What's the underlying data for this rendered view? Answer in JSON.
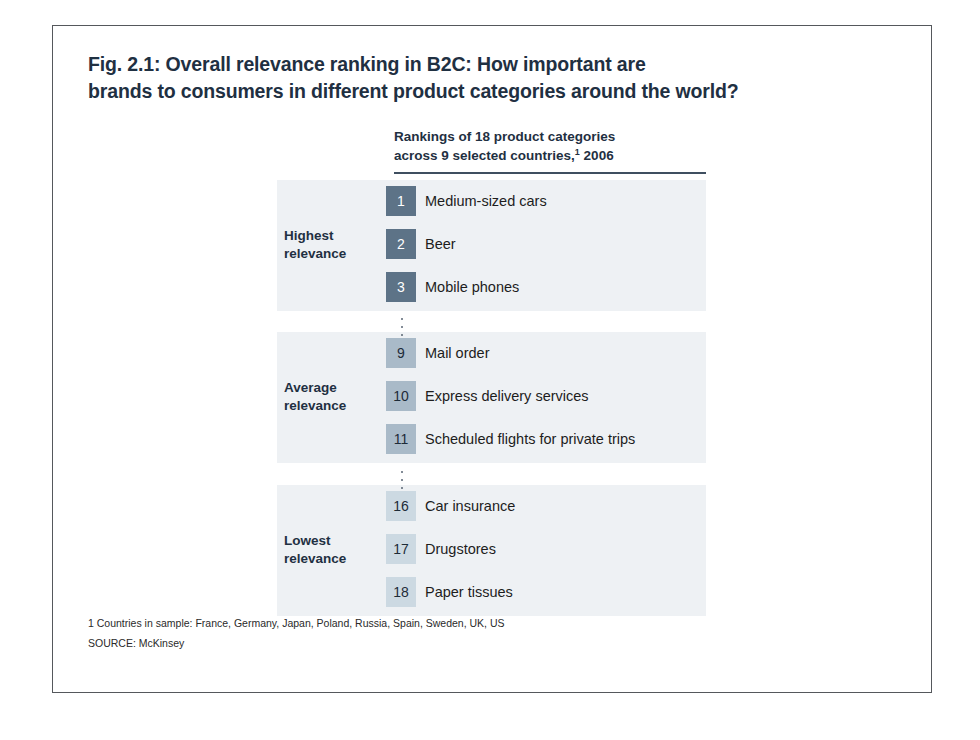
{
  "figure": {
    "title_lines": [
      "Fig. 2.1: Overall relevance ranking in B2C: How important are",
      "brands to consumers in different product categories around the world?"
    ],
    "subtitle_lines": [
      "Rankings of 18 product categories",
      "across 9 selected countries,"
    ],
    "subtitle_superscript": "1",
    "subtitle_tail": " 2006"
  },
  "colors": {
    "title_text": "#1f3042",
    "band_background": "#eef1f4",
    "rule": "#3f4f60",
    "box_high": "#5d7387",
    "box_high_text": "#ffffff",
    "box_average": "#a9bac8",
    "box_average_text": "#1d2b38",
    "box_lowest": "#ccd9e2",
    "box_lowest_text": "#1d2b38",
    "page_border": "#55585c"
  },
  "footnotes": [
    "1 Countries in sample: France, Germany, Japan, Poland, Russia, Spain, Sweden, UK, US",
    "SOURCE: McKinsey"
  ],
  "chart_data": {
    "type": "table",
    "title": "Fig. 2.1: Overall relevance ranking in B2C: How important are brands to consumers in different product categories around the world?",
    "subtitle": "Rankings of 18 product categories across 9 selected countries,1 2006",
    "xlabel": "",
    "ylabel": "",
    "columns": [
      "Rank",
      "Product category"
    ],
    "note": "18 product categories ranked; only ranks 1-3, 9-11 and 16-18 are shown, separated by vertical ellipses.",
    "groups": [
      {
        "label_lines": [
          "Highest",
          "relevance"
        ],
        "label": "Highest relevance",
        "box_color": "#5d7387",
        "box_text_color": "#ffffff",
        "rows": [
          {
            "rank": "1",
            "category": "Medium-sized cars"
          },
          {
            "rank": "2",
            "category": "Beer"
          },
          {
            "rank": "3",
            "category": "Mobile phones"
          }
        ]
      },
      {
        "label_lines": [
          "Average",
          "relevance"
        ],
        "label": "Average relevance",
        "box_color": "#a9bac8",
        "box_text_color": "#1d2b38",
        "rows": [
          {
            "rank": "9",
            "category": "Mail order"
          },
          {
            "rank": "10",
            "category": "Express delivery services"
          },
          {
            "rank": "11",
            "category": "Scheduled flights for private trips"
          }
        ]
      },
      {
        "label_lines": [
          "Lowest",
          "relevance"
        ],
        "label": "Lowest relevance",
        "box_color": "#ccd9e2",
        "box_text_color": "#1d2b38",
        "rows": [
          {
            "rank": "16",
            "category": "Car insurance"
          },
          {
            "rank": "17",
            "category": "Drugstores"
          },
          {
            "rank": "18",
            "category": "Paper tissues"
          }
        ]
      }
    ],
    "footnote": "1 Countries in sample: France, Germany, Japan, Poland, Russia, Spain, Sweden, UK, US",
    "source": "SOURCE: McKinsey"
  }
}
